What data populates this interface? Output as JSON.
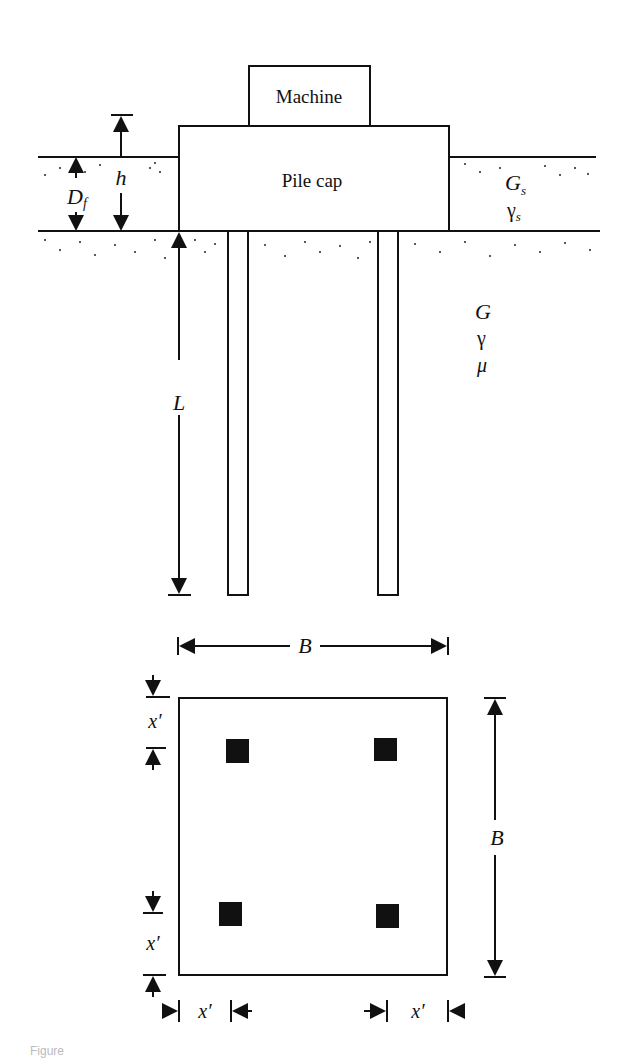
{
  "section_view": {
    "machine_label": "Machine",
    "pile_cap_label": "Pile cap",
    "dim_h": "h",
    "dim_Df": "D",
    "dim_Df_sub": "f",
    "dim_L": "L",
    "upper_layer": {
      "shear_modulus": "G",
      "shear_modulus_sub": "s",
      "unit_weight": "γ",
      "unit_weight_sub": "s"
    },
    "lower_layer": {
      "shear_modulus": "G",
      "unit_weight": "γ",
      "poisson": "μ"
    }
  },
  "plan_view": {
    "width_label": "B",
    "height_label": "B",
    "edge_distance_label": "x′",
    "pile_count": 4
  },
  "caption": "Figure"
}
